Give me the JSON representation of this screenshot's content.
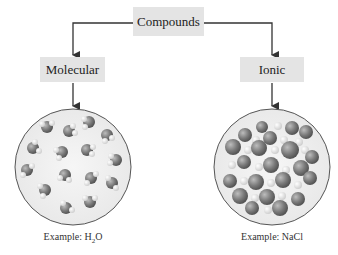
{
  "diagram": {
    "root": {
      "label": "Compounds"
    },
    "branches": [
      {
        "label": "Molecular",
        "example_prefix": "Example: ",
        "example_formula_main": "H",
        "example_formula_sub": "2",
        "example_formula_end": "O",
        "illustration": "discrete-molecules"
      },
      {
        "label": "Ionic",
        "example_prefix": "Example: ",
        "example_formula_main": "NaCl",
        "example_formula_sub": "",
        "example_formula_end": "",
        "illustration": "ionic-lattice"
      }
    ]
  }
}
